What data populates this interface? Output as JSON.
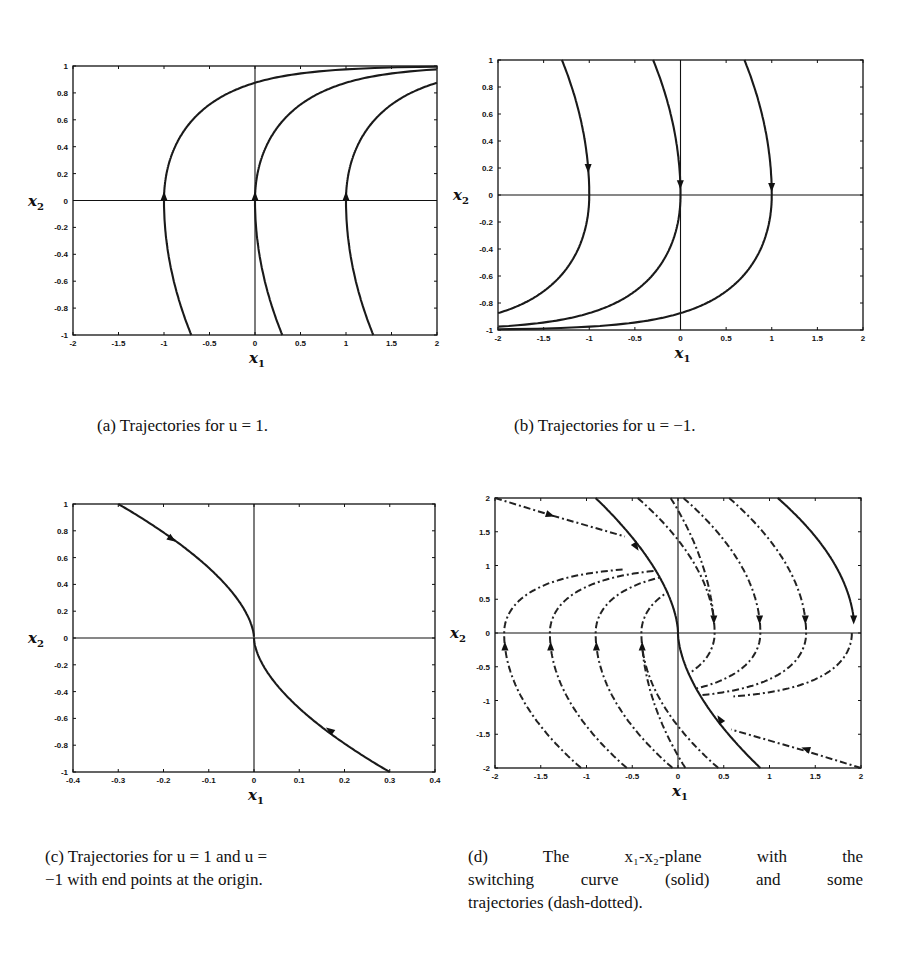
{
  "figure": {
    "panels": [
      {
        "id": "a",
        "caption": "(a) Trajectories for u = 1.",
        "box": {
          "left": 73,
          "top": 66,
          "right": 437,
          "bottom": 335
        },
        "xlim": [
          -2,
          2
        ],
        "ylim": [
          -1,
          1
        ],
        "xticks": [
          "-2",
          "-1.5",
          "-1",
          "-0.5",
          "0",
          "0.5",
          "1",
          "1.5",
          "2"
        ],
        "yticks": [
          "-1",
          "-0.8",
          "-0.6",
          "-0.4",
          "-0.2",
          "0",
          "0.2",
          "0.4",
          "0.6",
          "0.8",
          "1"
        ],
        "xlabel": "x",
        "xlabel_sub": "1",
        "ylabel": "x",
        "ylabel_sub": "2"
      },
      {
        "id": "b",
        "caption": "(b) Trajectories for u = −1.",
        "box": {
          "left": 498,
          "top": 60,
          "right": 863,
          "bottom": 330
        },
        "xlim": [
          -2,
          2
        ],
        "ylim": [
          -1,
          1
        ],
        "xticks": [
          "-2",
          "-1.5",
          "-1",
          "-0.5",
          "0",
          "0.5",
          "1",
          "1.5",
          "2"
        ],
        "yticks": [
          "-1",
          "-0.8",
          "-0.6",
          "-0.4",
          "-0.2",
          "0",
          "0.2",
          "0.4",
          "0.6",
          "0.8",
          "1"
        ],
        "xlabel": "x",
        "xlabel_sub": "1",
        "ylabel": "x",
        "ylabel_sub": "2"
      },
      {
        "id": "c",
        "caption_lines": [
          "(c) Trajectories for u = 1 and u =",
          "−1 with end points at the origin."
        ],
        "box": {
          "left": 73,
          "top": 504,
          "right": 435,
          "bottom": 772
        },
        "xlim": [
          -0.4,
          0.4
        ],
        "ylim": [
          -1,
          1
        ],
        "xticks": [
          "-0.4",
          "-0.3",
          "-0.2",
          "-0.1",
          "0",
          "0.1",
          "0.2",
          "0.3",
          "0.4"
        ],
        "yticks": [
          "-1",
          "-0.8",
          "-0.6",
          "-0.4",
          "-0.2",
          "0",
          "0.2",
          "0.4",
          "0.6",
          "0.8",
          "1"
        ],
        "xlabel": "x",
        "xlabel_sub": "1",
        "ylabel": "x",
        "ylabel_sub": "2"
      },
      {
        "id": "d",
        "caption_lines": [
          "(d) The x₁-x₂-plane with the",
          "switching curve (solid) and some",
          "trajectories (dash-dotted)."
        ],
        "box": {
          "left": 495,
          "top": 498,
          "right": 861,
          "bottom": 768
        },
        "xlim": [
          -2,
          2
        ],
        "ylim": [
          -2,
          2
        ],
        "xticks": [
          "-2",
          "-1.5",
          "-1",
          "-0.5",
          "0",
          "0.5",
          "1",
          "1.5",
          "2"
        ],
        "yticks": [
          "-2",
          "-1.5",
          "-1",
          "-0.5",
          "0",
          "0.5",
          "1",
          "1.5",
          "2"
        ],
        "xlabel": "x",
        "xlabel_sub": "1",
        "ylabel": "x",
        "ylabel_sub": "2"
      }
    ]
  },
  "chart_data": [
    {
      "type": "line",
      "title": "(a) Trajectories for u = 1.",
      "xlabel": "x1",
      "ylabel": "x2",
      "xlim": [
        -2,
        2
      ],
      "ylim": [
        -1,
        1
      ],
      "grid": false,
      "series": [
        {
          "name": "trajectory from x1=-1",
          "crossing_x1": -1,
          "start": [
            -0.7,
            -1
          ],
          "end": [
            2.0,
            1.0
          ],
          "direction": "upward",
          "arrow_at": [
            -1,
            0
          ]
        },
        {
          "name": "trajectory from x1=0",
          "crossing_x1": 0,
          "start": [
            0.3,
            -1
          ],
          "end": [
            2.0,
            0.97
          ],
          "direction": "upward",
          "arrow_at": [
            0,
            0
          ]
        },
        {
          "name": "trajectory from x1=1",
          "crossing_x1": 1,
          "start": [
            1.3,
            -1
          ],
          "end": [
            2.0,
            0.87
          ],
          "direction": "upward",
          "arrow_at": [
            1,
            0
          ]
        }
      ]
    },
    {
      "type": "line",
      "title": "(b) Trajectories for u = −1.",
      "xlabel": "x1",
      "ylabel": "x2",
      "xlim": [
        -2,
        2
      ],
      "ylim": [
        -1,
        1
      ],
      "grid": false,
      "series": [
        {
          "name": "trajectory through x1=-1",
          "crossing_x1": -1,
          "start": [
            -1.3,
            1
          ],
          "end": [
            -2.0,
            -0.84
          ],
          "direction": "downward",
          "arrow_at": [
            -1,
            0.2
          ]
        },
        {
          "name": "trajectory through x1=0",
          "crossing_x1": 0,
          "start": [
            -0.3,
            1
          ],
          "end": [
            -2.0,
            -0.95
          ],
          "direction": "downward",
          "arrow_at": [
            0,
            0.08
          ]
        },
        {
          "name": "trajectory through x1=1",
          "crossing_x1": 1,
          "start": [
            0.7,
            1
          ],
          "end": [
            -2.0,
            -0.98
          ],
          "direction": "downward",
          "arrow_at": [
            1,
            0.06
          ]
        }
      ]
    },
    {
      "type": "line",
      "title": "(c) Trajectories for u = 1 and u = −1 with end points at the origin.",
      "xlabel": "x1",
      "ylabel": "x2",
      "xlim": [
        -0.4,
        0.4
      ],
      "ylim": [
        -1,
        1
      ],
      "grid": false,
      "series": [
        {
          "name": "u = -1 branch",
          "start": [
            -0.3,
            1
          ],
          "end": [
            0,
            0
          ],
          "arrow_at": [
            -0.18,
            0.74
          ]
        },
        {
          "name": "u = 1 branch",
          "start": [
            0.3,
            -1
          ],
          "end": [
            0,
            0
          ],
          "arrow_at": [
            0.17,
            -0.68
          ]
        }
      ]
    },
    {
      "type": "line",
      "title": "(d) The x1-x2-plane with the switching curve (solid) and some trajectories (dash-dotted).",
      "xlabel": "x1",
      "ylabel": "x2",
      "xlim": [
        -2,
        2
      ],
      "ylim": [
        -2,
        2
      ],
      "grid": false,
      "series": [
        {
          "name": "switching curve (solid)",
          "style": "solid",
          "points": [
            [
              -0.9,
              2
            ],
            [
              -0.5,
              1.3
            ],
            [
              0,
              0
            ],
            [
              0.5,
              -1.3
            ],
            [
              0.9,
              -2
            ]
          ]
        },
        {
          "name": "second solid curve",
          "style": "solid",
          "points": [
            [
              1.1,
              2
            ],
            [
              1.9,
              0.3
            ],
            [
              1.93,
              0
            ]
          ]
        },
        {
          "name": "trajectories (dash-dotted)",
          "style": "dash-dotted",
          "crossings_x1_upper_left": [
            -1.9,
            -1.4,
            -0.9,
            -0.4
          ],
          "crossings_x1_lower_right": [
            0.4,
            0.9,
            1.4,
            1.9
          ],
          "entry_points": [
            [
              -2,
              2
            ],
            [
              2,
              -2
            ]
          ]
        }
      ]
    }
  ]
}
